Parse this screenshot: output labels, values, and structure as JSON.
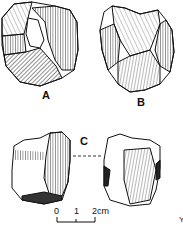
{
  "figure": {
    "labels": {
      "a": "A",
      "b": "B",
      "c": "C"
    },
    "scale_bar": {
      "tick0": "0",
      "tick1": "1",
      "tick2": "2cm"
    },
    "corner_mark": "Y"
  }
}
